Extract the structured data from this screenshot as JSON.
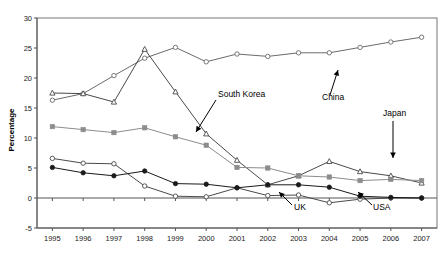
{
  "chart_data": {
    "type": "line",
    "title": "",
    "xlabel": "",
    "ylabel": "Percentage",
    "categories": [
      "1995",
      "1996",
      "1997",
      "1998",
      "1999",
      "2000",
      "2001",
      "2002",
      "2003",
      "2004",
      "2005",
      "2006",
      "2007"
    ],
    "ylim": [
      -5,
      30
    ],
    "yticks": [
      -5,
      0,
      5,
      10,
      15,
      20,
      25,
      30
    ],
    "ytick_labels": [
      "-5",
      "0",
      "5",
      "10",
      "15",
      "20",
      "25",
      "30"
    ],
    "grid": false,
    "legend": "none",
    "annotations": [
      {
        "label": "South Korea",
        "points_to": "south-korea-series"
      },
      {
        "label": "China",
        "points_to": "china-series"
      },
      {
        "label": "Japan",
        "points_to": "japan-series"
      },
      {
        "label": "UK",
        "points_to": "uk-series"
      },
      {
        "label": "USA",
        "points_to": "usa-series"
      }
    ],
    "series": [
      {
        "name": "China",
        "marker": "open-circle",
        "color": "#6b6b6b",
        "values": [
          16.3,
          17.4,
          20.4,
          23.3,
          25.1,
          22.7,
          24.0,
          23.6,
          24.2,
          24.2,
          25.1,
          26.0,
          26.8
        ]
      },
      {
        "name": "South Korea",
        "marker": "open-triangle",
        "color": "#4a4a4a",
        "values": [
          17.5,
          17.4,
          16.0,
          24.8,
          17.7,
          10.7,
          6.3,
          2.2,
          3.7,
          6.1,
          4.4,
          3.7,
          2.5
        ]
      },
      {
        "name": "Japan",
        "marker": "filled-square",
        "color": "#8c8c8c",
        "values": [
          11.9,
          11.4,
          10.9,
          11.7,
          10.2,
          8.8,
          5.1,
          5.0,
          3.7,
          3.5,
          2.9,
          3.1,
          2.9
        ]
      },
      {
        "name": "UK",
        "marker": "open-circle",
        "color": "#4a4a4a",
        "values": [
          6.6,
          5.8,
          5.7,
          2.0,
          0.3,
          0.2,
          1.7,
          0.4,
          0.5,
          -0.8,
          -0.2,
          0.0,
          0.0
        ]
      },
      {
        "name": "USA",
        "marker": "filled-circle",
        "color": "#1a1a1a",
        "values": [
          5.1,
          4.2,
          3.7,
          4.5,
          2.4,
          2.3,
          1.7,
          2.2,
          2.2,
          1.8,
          0.3,
          0.1,
          0.0
        ]
      }
    ]
  }
}
